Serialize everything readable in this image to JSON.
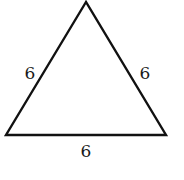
{
  "diagram": {
    "shape": "equilateral-triangle",
    "vertices": [
      [
        86,
        2
      ],
      [
        6,
        135
      ],
      [
        166,
        135
      ]
    ],
    "stroke_color": "#111111",
    "sides": {
      "left": "6",
      "right": "6",
      "bottom": "6"
    }
  }
}
